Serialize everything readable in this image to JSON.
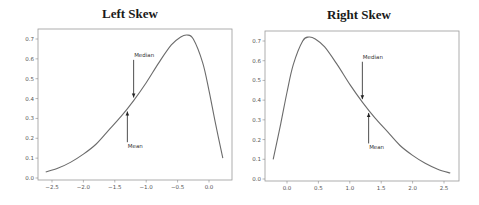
{
  "chart_data": [
    {
      "type": "line",
      "title": "Left Skew",
      "xlabel": "",
      "ylabel": "",
      "xlim": [
        -2.7,
        0.3
      ],
      "ylim": [
        0.0,
        0.75
      ],
      "grid": false,
      "legend": null,
      "x_ticks": [
        "-2.5",
        "-2.0",
        "-1.5",
        "-1.0",
        "-0.5",
        "0.0"
      ],
      "y_ticks": [
        "0.0",
        "0.1",
        "0.2",
        "0.3",
        "0.4",
        "0.5",
        "0.6",
        "0.7"
      ],
      "series": [
        {
          "name": "density",
          "x": [
            -2.6,
            -2.4,
            -2.2,
            -2.0,
            -1.8,
            -1.6,
            -1.4,
            -1.2,
            -1.0,
            -0.8,
            -0.6,
            -0.45,
            -0.35,
            -0.25,
            -0.1,
            0.0,
            0.1,
            0.22
          ],
          "y": [
            0.03,
            0.05,
            0.08,
            0.12,
            0.17,
            0.24,
            0.31,
            0.39,
            0.48,
            0.58,
            0.67,
            0.71,
            0.72,
            0.7,
            0.58,
            0.44,
            0.28,
            0.1
          ]
        }
      ],
      "annotations": [
        {
          "text": "Median",
          "x": -1.2,
          "y": 0.4,
          "text_x": -1.18,
          "text_y": 0.61
        },
        {
          "text": "Mean",
          "x": -1.3,
          "y": 0.34,
          "text_x": -1.28,
          "text_y": 0.15
        }
      ]
    },
    {
      "type": "line",
      "title": "Right Skew",
      "xlabel": "",
      "ylabel": "",
      "xlim": [
        -0.3,
        2.7
      ],
      "ylim": [
        0.0,
        0.75
      ],
      "grid": false,
      "legend": null,
      "x_ticks": [
        "0.0",
        "0.5",
        "1.0",
        "1.5",
        "2.0",
        "2.5"
      ],
      "y_ticks": [
        "0.0",
        "0.1",
        "0.2",
        "0.3",
        "0.4",
        "0.5",
        "0.6",
        "0.7"
      ],
      "series": [
        {
          "name": "density",
          "x": [
            -0.22,
            -0.1,
            0.0,
            0.1,
            0.25,
            0.35,
            0.45,
            0.6,
            0.8,
            1.0,
            1.2,
            1.4,
            1.6,
            1.8,
            2.0,
            2.2,
            2.4,
            2.6
          ],
          "y": [
            0.1,
            0.28,
            0.44,
            0.58,
            0.7,
            0.72,
            0.71,
            0.67,
            0.58,
            0.48,
            0.39,
            0.31,
            0.24,
            0.17,
            0.12,
            0.08,
            0.05,
            0.03
          ]
        }
      ],
      "annotations": [
        {
          "text": "Median",
          "x": 1.2,
          "y": 0.4,
          "text_x": 1.18,
          "text_y": 0.61
        },
        {
          "text": "Mean",
          "x": 1.3,
          "y": 0.34,
          "text_x": 1.28,
          "text_y": 0.15
        }
      ]
    }
  ]
}
